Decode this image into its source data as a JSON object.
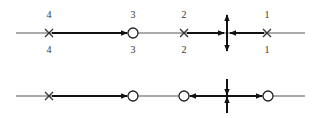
{
  "colors": {
    "line": "#555555",
    "arrow": "#111111",
    "background": "#ffffff"
  },
  "top_row": {
    "y": 33,
    "x_start": 16,
    "x_end": 305,
    "labels_above": [
      {
        "x": 49,
        "text": "4"
      },
      {
        "x": 133,
        "text": "3"
      },
      {
        "x": 184,
        "text": "2"
      },
      {
        "x": 267,
        "text": "1"
      }
    ],
    "labels_below": [
      {
        "x": 49,
        "text": "4"
      },
      {
        "x": 133,
        "text": "3"
      },
      {
        "x": 184,
        "text": "2"
      },
      {
        "x": 267,
        "text": "1"
      }
    ],
    "nodes": [
      {
        "x": 49,
        "type": "cross"
      },
      {
        "x": 133,
        "type": "open-circle"
      },
      {
        "x": 184,
        "type": "cross"
      },
      {
        "x": 227,
        "type": "saddle-diverging-vertical"
      },
      {
        "x": 267,
        "type": "cross"
      }
    ],
    "arrows": [
      {
        "from": 49,
        "to": 133,
        "direction": "right"
      },
      {
        "from": 184,
        "to": 227,
        "direction": "right"
      },
      {
        "from": 267,
        "to": 227,
        "direction": "left"
      }
    ]
  },
  "bottom_row": {
    "y": 96,
    "x_start": 16,
    "x_end": 305,
    "nodes": [
      {
        "x": 49,
        "type": "cross"
      },
      {
        "x": 133,
        "type": "open-circle"
      },
      {
        "x": 184,
        "type": "open-circle"
      },
      {
        "x": 227,
        "type": "saddle-converging-vertical"
      },
      {
        "x": 268,
        "type": "open-circle"
      }
    ],
    "arrows": [
      {
        "from": 49,
        "to": 133,
        "direction": "right"
      },
      {
        "from": 227,
        "to": 184,
        "direction": "left"
      },
      {
        "from": 227,
        "to": 268,
        "direction": "right"
      }
    ]
  }
}
